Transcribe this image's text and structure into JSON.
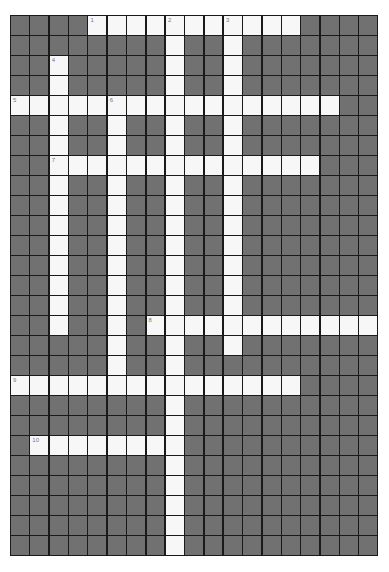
{
  "puzzle": {
    "cols": 19,
    "rows": 27,
    "cell_width": 19.37,
    "cell_height": 20,
    "colors": {
      "blocked": "#717171",
      "open": "#f7f7f7",
      "grid_line": "#1a1a1a",
      "number": "#777777"
    },
    "entries": [
      {
        "number": "1",
        "direction": "across",
        "row": 0,
        "col": 4,
        "length": 11
      },
      {
        "number": "2",
        "direction": "down",
        "row": 0,
        "col": 8,
        "length": 27
      },
      {
        "number": "3",
        "direction": "down",
        "row": 0,
        "col": 11,
        "length": 17
      },
      {
        "number": "4",
        "direction": "down",
        "row": 2,
        "col": 2,
        "length": 14
      },
      {
        "number": "5",
        "direction": "across",
        "row": 4,
        "col": 0,
        "length": 17
      },
      {
        "number": "6",
        "direction": "down",
        "row": 4,
        "col": 5,
        "length": 15
      },
      {
        "number": "7",
        "direction": "across",
        "row": 7,
        "col": 2,
        "length": 14
      },
      {
        "number": "8",
        "direction": "across",
        "row": 15,
        "col": 7,
        "length": 12
      },
      {
        "number": "9",
        "direction": "across",
        "row": 18,
        "col": 0,
        "length": 15
      },
      {
        "number": "10",
        "direction": "across",
        "row": 21,
        "col": 1,
        "length": 8
      }
    ]
  }
}
